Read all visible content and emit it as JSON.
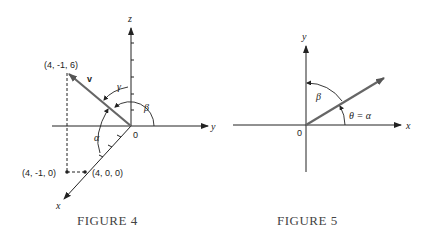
{
  "figure4": {
    "caption": "FIGURE 4",
    "axes": {
      "x": "x",
      "y": "y",
      "z": "z"
    },
    "origin_label": "0",
    "vector_label": "v",
    "points": {
      "tip": "(4, -1, 6)",
      "proj_xy": "(4, -1, 0)",
      "on_x": "(4, 0, 0)"
    },
    "angles": {
      "alpha": "α",
      "beta": "β",
      "gamma": "γ"
    }
  },
  "figure5": {
    "caption": "FIGURE 5",
    "axes": {
      "x": "x",
      "y": "y"
    },
    "origin_label": "0",
    "angles": {
      "beta": "β",
      "theta_alpha": "θ = α"
    }
  },
  "colors": {
    "line": "#222222",
    "vector": "#666666",
    "caption": "#444444"
  }
}
